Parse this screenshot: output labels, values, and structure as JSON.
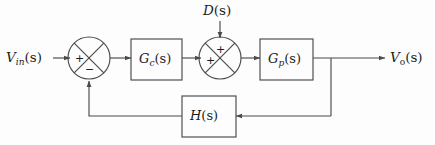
{
  "diagram": {
    "type": "control-system-block-diagram",
    "background_color": "#fdfdfd",
    "line_color": "#4a4a4a",
    "text_color": "#1c1c1c",
    "signals": {
      "input": {
        "base": "V",
        "subscript": "in",
        "arg": "(s)",
        "full": "V_in(s)"
      },
      "disturbance": {
        "base": "D",
        "arg": "(s)",
        "full": "D(s)"
      },
      "output": {
        "base": "V",
        "subscript": "o",
        "arg": "(s)",
        "full": "V_o(s)"
      }
    },
    "blocks": [
      {
        "name": "controller",
        "base": "G",
        "subscript": "c",
        "arg": "(s)",
        "full": "G_c(s)"
      },
      {
        "name": "plant",
        "base": "G",
        "subscript": "p",
        "arg": "(s)",
        "full": "G_p(s)"
      },
      {
        "name": "feedback",
        "base": "H",
        "arg": "(s)",
        "full": "H(s)"
      }
    ],
    "summing_junctions": [
      {
        "name": "error-junction",
        "input_sign": "+",
        "feedback_sign": "−"
      },
      {
        "name": "disturbance-junction",
        "forward_sign": "+",
        "disturbance_sign": "+"
      }
    ]
  }
}
